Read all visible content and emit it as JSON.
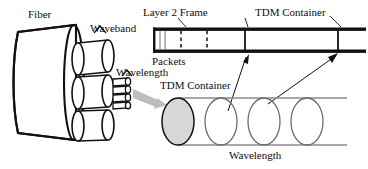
{
  "diagram": {
    "title_semantic": "optical-network-hierarchy",
    "labels": {
      "fiber": "Fiber",
      "waveband": "Waveband",
      "wavelength_left": "Wavelength",
      "layer2_frame": "Layer 2 Frame",
      "packets": "Packets",
      "tdm_container_top": "TDM Container",
      "tdm_container_bottom": "TDM Container",
      "wavelength_bottom": "Wavelength"
    },
    "colors": {
      "ink": "#111111",
      "gray_arrow": "#b4b4b4",
      "gray_fill": "#d9d9d9",
      "gray_line": "#8a8a8a",
      "white": "#ffffff"
    },
    "frame_bar": {
      "packet_dividers": 3,
      "tdm_container_count": 2,
      "solid_dividers": 2
    },
    "wavelength_cylinder": {
      "ellipse_count": 4,
      "filled_ellipse_index": 0
    },
    "fiber": {
      "waveband_count": 3,
      "wavelength_stack_count": 4
    }
  }
}
